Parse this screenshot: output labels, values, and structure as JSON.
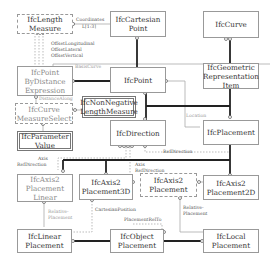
{
  "entities": {
    "length_measure": "IfcLength Measure",
    "cartesian_point": "IfcCartesian Point",
    "curve": "IfcCurve",
    "point_by_distance": "IfcPoint ByDistance Expression",
    "point": "IfcPoint",
    "geometric_repr_item": "IfcGeometric Representation Item",
    "non_negative_length": "IfcNonNegative LengthMeasure",
    "curve_measure_select": "IfcCurve MeasureSelect",
    "parameter_value": "IfcParameter Value",
    "direction": "IfcDirection",
    "placement": "IfcPlacement",
    "axis2_placement_linear": "IfcAxis2 Placement Linear",
    "axis2_placement_3d": "IfcAxis2 Placement3D",
    "axis2_placement": "IfcAxis2 Placement",
    "axis2_placement_2d": "IfcAxis2 Placement2D",
    "linear_placement": "IfcLinear Placement",
    "object_placement": "IfcObject Placement",
    "local_placement": "IfcLocal Placement"
  },
  "relations": {
    "coordinates": "Coordinates",
    "coordinates_card": "L[1:3]",
    "offset_longitudinal": "OffsetLongitudinal",
    "offset_lateral": "OffsetLateral",
    "offset_vertical": "OffsetVertical",
    "basis_curve": "BasisCurve",
    "distance_along": "DistanceAlong",
    "location": "Location",
    "ref_direction": "RefDirection",
    "axis_ref_left_1": "Axis",
    "axis_ref_left_2": "RefDirection",
    "axis_ref_mid_1": "Axis",
    "axis_ref_mid_2": "RefDirection",
    "cartesian_position": "CartesianPosition",
    "placement_rel_to": "PlacementRelTo",
    "relative_placement_left_1": "Relative-",
    "relative_placement_left_2": "Placement",
    "relative_placement_right_1": "Relative-",
    "relative_placement_right_2": "Placement"
  }
}
